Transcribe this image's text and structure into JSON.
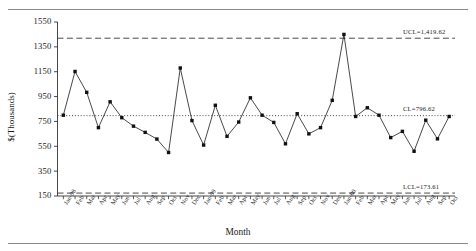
{
  "chart_data": {
    "type": "line",
    "title": "",
    "xlabel": "Month",
    "ylabel": "$(Thousands)",
    "ylim": [
      150,
      1550
    ],
    "yticks": [
      150,
      350,
      550,
      750,
      950,
      1150,
      1350,
      1550
    ],
    "ytick_labels": [
      "150",
      "350",
      "550",
      "750",
      "950",
      "1150",
      "1350",
      "1550"
    ],
    "grid": false,
    "legend": "none",
    "categories": [
      "Jan-98",
      "Feb",
      "Mar",
      "Apr",
      "May",
      "Jun",
      "Jul",
      "Aug",
      "Sep",
      "Oct",
      "Nov",
      "Dec",
      "Jan-99",
      "Feb",
      "Mar",
      "Apr",
      "May",
      "Jun",
      "Jul",
      "Aug",
      "Sep",
      "Oct",
      "Nov",
      "Dec",
      "Jan-00",
      "Feb",
      "Mar",
      "Apr",
      "May",
      "Jun",
      "Jul",
      "Aug",
      "Sep",
      "Oct"
    ],
    "series": [
      {
        "name": "Monthly value",
        "marker": "square",
        "values": [
          800,
          1152,
          984,
          700,
          908,
          780,
          712,
          662,
          608,
          500,
          1180,
          757,
          560,
          880,
          630,
          745,
          940,
          800,
          742,
          570,
          812,
          650,
          700,
          920,
          1450,
          790,
          860,
          800,
          620,
          670,
          510,
          760,
          610,
          790
        ]
      }
    ],
    "control_limits": [
      {
        "key": "ucl",
        "label": "UCL=1,419.62",
        "value": 1419.62,
        "style": "dashed"
      },
      {
        "key": "cl",
        "label": "CL=796.62",
        "value": 796.62,
        "style": "dotted"
      },
      {
        "key": "lcl",
        "label": "LCL=173.61",
        "value": 173.61,
        "style": "dashed"
      }
    ]
  }
}
